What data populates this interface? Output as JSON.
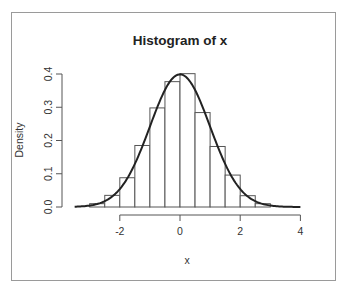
{
  "chart_data": {
    "type": "bar",
    "title": "Histogram of x",
    "xlabel": "x",
    "ylabel": "Density",
    "xlim": [
      -3.5,
      4
    ],
    "ylim": [
      0,
      0.4
    ],
    "x_ticks": [
      -2,
      0,
      2,
      4
    ],
    "x_tick_labels": [
      "-2",
      "0",
      "2",
      "4"
    ],
    "y_ticks": [
      0.0,
      0.1,
      0.2,
      0.3,
      0.4
    ],
    "y_tick_labels": [
      "0.0",
      "0.1",
      "0.2",
      "0.3",
      "0.4"
    ],
    "grid": false,
    "legend": null,
    "bins": [
      {
        "from": -3.0,
        "to": -2.5,
        "density": 0.01
      },
      {
        "from": -2.5,
        "to": -2.0,
        "density": 0.035
      },
      {
        "from": -2.0,
        "to": -1.5,
        "density": 0.088
      },
      {
        "from": -1.5,
        "to": -1.0,
        "density": 0.185
      },
      {
        "from": -1.0,
        "to": -0.5,
        "density": 0.298
      },
      {
        "from": -0.5,
        "to": 0.0,
        "density": 0.377
      },
      {
        "from": 0.0,
        "to": 0.5,
        "density": 0.401
      },
      {
        "from": 0.5,
        "to": 1.0,
        "density": 0.284
      },
      {
        "from": 1.0,
        "to": 1.5,
        "density": 0.182
      },
      {
        "from": 1.5,
        "to": 2.0,
        "density": 0.096
      },
      {
        "from": 2.0,
        "to": 2.5,
        "density": 0.034
      },
      {
        "from": 2.5,
        "to": 3.0,
        "density": 0.01
      }
    ],
    "overlay": {
      "type": "line",
      "name": "normal density curve",
      "mean": 0,
      "sd": 1,
      "x_range": [
        -3.5,
        4
      ]
    }
  },
  "colors": {
    "bar_fill": "#ffffff",
    "bar_stroke": "#555555",
    "curve": "#222222",
    "axis": "#555555",
    "frame": "#9a9a9a"
  }
}
